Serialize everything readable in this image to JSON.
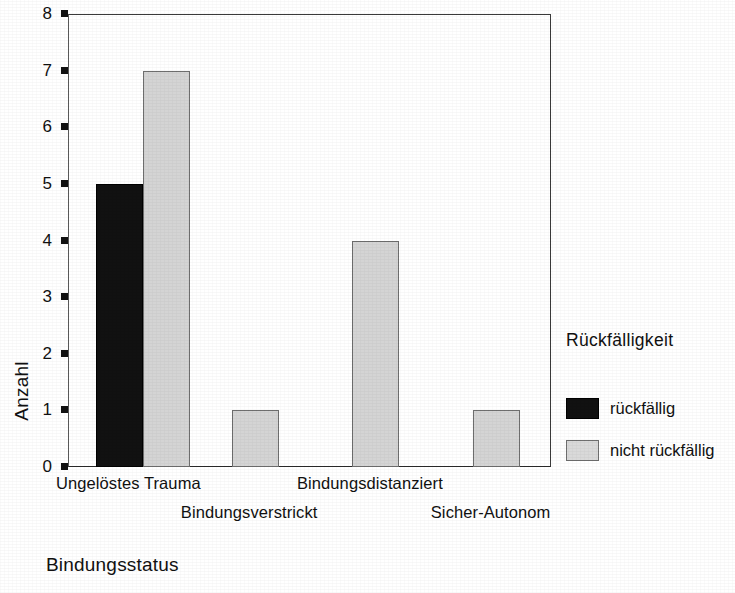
{
  "chart_data": {
    "type": "bar",
    "title": "",
    "xlabel": "Bindungsstatus",
    "ylabel": "Anzahl",
    "ylim": [
      0,
      8
    ],
    "yticks": [
      "0",
      "1",
      "2",
      "3",
      "4",
      "5",
      "6",
      "7",
      "8"
    ],
    "grid": false,
    "legend_position": "right",
    "legend_title": "Rückfälligkeit",
    "categories": [
      "Ungelöstes Trauma",
      "Bindungsverstrickt",
      "Bindungsdistanziert",
      "Sicher-Autonom"
    ],
    "category_label_rows": [
      0,
      1,
      0,
      1
    ],
    "series": [
      {
        "name": "rückfällig",
        "color": "#111111",
        "values": [
          5,
          0,
          0,
          0
        ]
      },
      {
        "name": "nicht rückfällig",
        "color": "#d4d4d4",
        "values": [
          7,
          1,
          4,
          1
        ]
      }
    ]
  },
  "axis": {
    "y_label": "Anzahl",
    "x_label": "Bindungsstatus"
  },
  "legend": {
    "title": "Rückfälligkeit",
    "entries": [
      {
        "label": "rückfällig",
        "color": "#111111"
      },
      {
        "label": "nicht rückfällig",
        "color": "#d4d4d4"
      }
    ]
  }
}
